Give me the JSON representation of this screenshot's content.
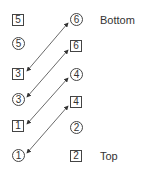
{
  "diagram": {
    "left_column": [
      {
        "kind": "box",
        "text": "5",
        "x": 12,
        "y": 14
      },
      {
        "kind": "circle",
        "text": "5",
        "x": 12,
        "y": 37
      },
      {
        "kind": "box",
        "text": "3",
        "x": 12,
        "y": 68
      },
      {
        "kind": "circle",
        "text": "3",
        "x": 12,
        "y": 93
      },
      {
        "kind": "box",
        "text": "1",
        "x": 12,
        "y": 120
      },
      {
        "kind": "circle",
        "text": "1",
        "x": 12,
        "y": 149
      }
    ],
    "right_column": [
      {
        "kind": "circle",
        "text": "6",
        "x": 70,
        "y": 13
      },
      {
        "kind": "box",
        "text": "6",
        "x": 70,
        "y": 40
      },
      {
        "kind": "circle",
        "text": "4",
        "x": 70,
        "y": 68
      },
      {
        "kind": "box",
        "text": "4",
        "x": 70,
        "y": 96
      },
      {
        "kind": "circle",
        "text": "2",
        "x": 70,
        "y": 121
      },
      {
        "kind": "box",
        "text": "2",
        "x": 70,
        "y": 150
      }
    ],
    "labels": {
      "bottom": "Bottom",
      "top": "Top"
    },
    "arrows": [
      {
        "from": "circle 6",
        "to": "box 3"
      },
      {
        "from": "box 6",
        "to": "circle 3"
      },
      {
        "from": "circle 4",
        "to": "box 1"
      },
      {
        "from": "box 4",
        "to": "circle 1"
      }
    ]
  }
}
